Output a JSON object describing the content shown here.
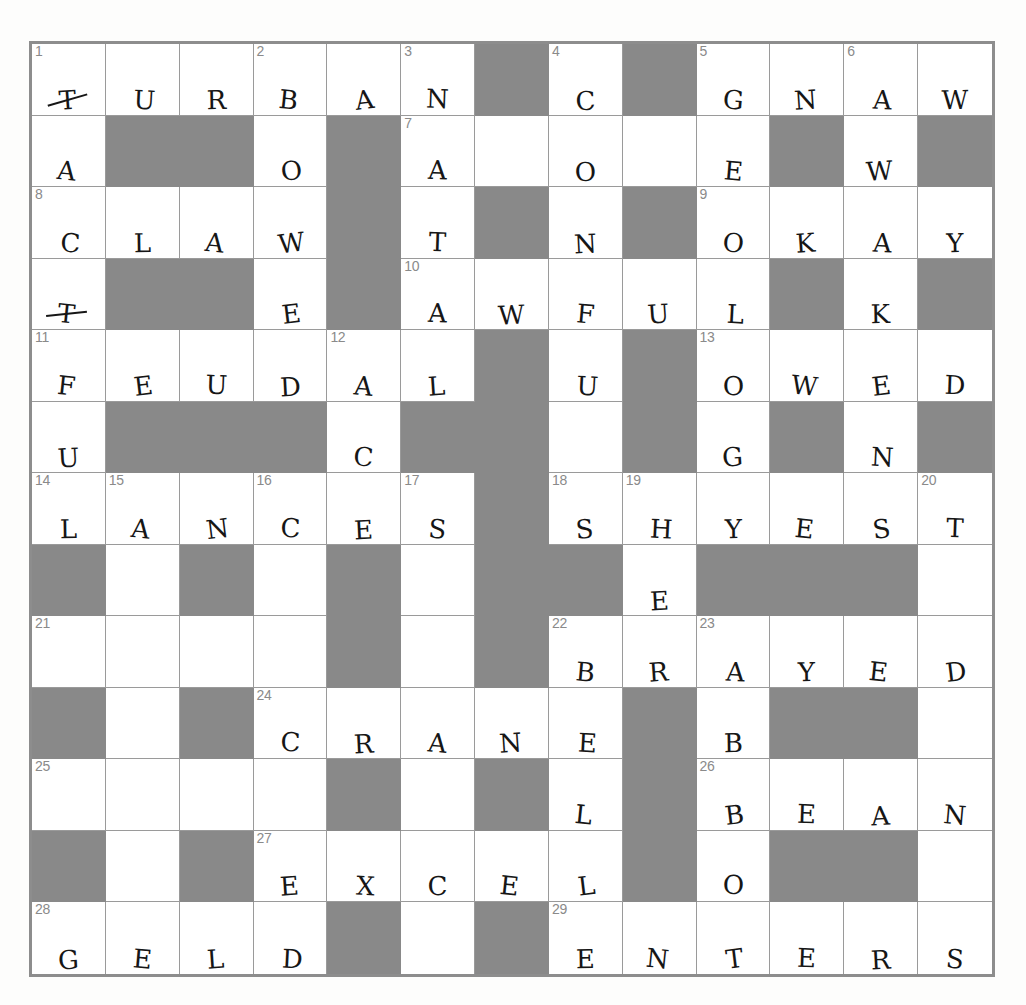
{
  "puzzle": {
    "kind": "crossword-grid",
    "columns": 13,
    "rows": 13,
    "block_color": "#898989",
    "cell_color": "#ffffff",
    "grid_line_color": "#9a9a9a",
    "border_color": "#8d8d8d",
    "number_color": "#8a8a8a",
    "letter_color": "#161616",
    "cells": [
      [
        {
          "t": "o",
          "n": "1",
          "l": "T",
          "s": true
        },
        {
          "t": "o",
          "l": "U"
        },
        {
          "t": "o",
          "l": "R"
        },
        {
          "t": "o",
          "n": "2",
          "l": "B"
        },
        {
          "t": "o",
          "l": "A"
        },
        {
          "t": "o",
          "n": "3",
          "l": "N"
        },
        {
          "t": "b"
        },
        {
          "t": "o",
          "n": "4",
          "l": "C"
        },
        {
          "t": "b"
        },
        {
          "t": "o",
          "n": "5",
          "l": "G"
        },
        {
          "t": "o",
          "l": "N"
        },
        {
          "t": "o",
          "n": "6",
          "l": "A"
        },
        {
          "t": "o",
          "l": "W"
        }
      ],
      [
        {
          "t": "o",
          "l": "A"
        },
        {
          "t": "b"
        },
        {
          "t": "b"
        },
        {
          "t": "o",
          "l": "O"
        },
        {
          "t": "b"
        },
        {
          "t": "o",
          "n": "7",
          "l": "A"
        },
        {
          "t": "o",
          "l": ""
        },
        {
          "t": "o",
          "l": "O"
        },
        {
          "t": "o",
          "l": ""
        },
        {
          "t": "o",
          "l": "E"
        },
        {
          "t": "b"
        },
        {
          "t": "o",
          "l": "W"
        },
        {
          "t": "b"
        }
      ],
      [
        {
          "t": "o",
          "n": "8",
          "l": "C"
        },
        {
          "t": "o",
          "l": "L"
        },
        {
          "t": "o",
          "l": "A"
        },
        {
          "t": "o",
          "l": "W"
        },
        {
          "t": "b"
        },
        {
          "t": "o",
          "l": "T"
        },
        {
          "t": "b"
        },
        {
          "t": "o",
          "l": "N"
        },
        {
          "t": "b"
        },
        {
          "t": "o",
          "n": "9",
          "l": "O"
        },
        {
          "t": "o",
          "l": "K"
        },
        {
          "t": "o",
          "l": "A"
        },
        {
          "t": "o",
          "l": "Y"
        }
      ],
      [
        {
          "t": "o",
          "l": "T",
          "s": true
        },
        {
          "t": "b"
        },
        {
          "t": "b"
        },
        {
          "t": "o",
          "l": "E"
        },
        {
          "t": "b"
        },
        {
          "t": "o",
          "n": "10",
          "l": "A"
        },
        {
          "t": "o",
          "l": "W"
        },
        {
          "t": "o",
          "l": "F"
        },
        {
          "t": "o",
          "l": "U"
        },
        {
          "t": "o",
          "l": "L"
        },
        {
          "t": "b"
        },
        {
          "t": "o",
          "l": "K"
        },
        {
          "t": "b"
        }
      ],
      [
        {
          "t": "o",
          "n": "11",
          "l": "F"
        },
        {
          "t": "o",
          "l": "E"
        },
        {
          "t": "o",
          "l": "U"
        },
        {
          "t": "o",
          "l": "D"
        },
        {
          "t": "o",
          "n": "12",
          "l": "A"
        },
        {
          "t": "o",
          "l": "L"
        },
        {
          "t": "b"
        },
        {
          "t": "o",
          "l": "U"
        },
        {
          "t": "b"
        },
        {
          "t": "o",
          "n": "13",
          "l": "O"
        },
        {
          "t": "o",
          "l": "W"
        },
        {
          "t": "o",
          "l": "E"
        },
        {
          "t": "o",
          "l": "D"
        }
      ],
      [
        {
          "t": "o",
          "l": "U"
        },
        {
          "t": "b"
        },
        {
          "t": "b"
        },
        {
          "t": "b"
        },
        {
          "t": "o",
          "l": "C"
        },
        {
          "t": "b"
        },
        {
          "t": "b"
        },
        {
          "t": "o",
          "l": ""
        },
        {
          "t": "b"
        },
        {
          "t": "o",
          "l": "G"
        },
        {
          "t": "b"
        },
        {
          "t": "o",
          "l": "N"
        },
        {
          "t": "b"
        }
      ],
      [
        {
          "t": "o",
          "n": "14",
          "l": "L"
        },
        {
          "t": "o",
          "n": "15",
          "l": "A"
        },
        {
          "t": "o",
          "l": "N"
        },
        {
          "t": "o",
          "n": "16",
          "l": "C"
        },
        {
          "t": "o",
          "l": "E"
        },
        {
          "t": "o",
          "n": "17",
          "l": "S"
        },
        {
          "t": "b"
        },
        {
          "t": "o",
          "n": "18",
          "l": "S"
        },
        {
          "t": "o",
          "n": "19",
          "l": "H"
        },
        {
          "t": "o",
          "l": "Y"
        },
        {
          "t": "o",
          "l": "E"
        },
        {
          "t": "o",
          "l": "S"
        },
        {
          "t": "o",
          "n": "20",
          "l": "T"
        }
      ],
      [
        {
          "t": "b"
        },
        {
          "t": "o",
          "l": ""
        },
        {
          "t": "b"
        },
        {
          "t": "o",
          "l": ""
        },
        {
          "t": "b"
        },
        {
          "t": "o",
          "l": ""
        },
        {
          "t": "b"
        },
        {
          "t": "b"
        },
        {
          "t": "o",
          "l": "E"
        },
        {
          "t": "b"
        },
        {
          "t": "b"
        },
        {
          "t": "b"
        },
        {
          "t": "o",
          "l": ""
        }
      ],
      [
        {
          "t": "o",
          "n": "21",
          "l": ""
        },
        {
          "t": "o",
          "l": ""
        },
        {
          "t": "o",
          "l": ""
        },
        {
          "t": "o",
          "l": ""
        },
        {
          "t": "b"
        },
        {
          "t": "o",
          "l": ""
        },
        {
          "t": "b"
        },
        {
          "t": "o",
          "n": "22",
          "l": "B"
        },
        {
          "t": "o",
          "l": "R"
        },
        {
          "t": "o",
          "n": "23",
          "l": "A"
        },
        {
          "t": "o",
          "l": "Y"
        },
        {
          "t": "o",
          "l": "E"
        },
        {
          "t": "o",
          "l": "D"
        }
      ],
      [
        {
          "t": "b"
        },
        {
          "t": "o",
          "l": ""
        },
        {
          "t": "b"
        },
        {
          "t": "o",
          "n": "24",
          "l": "C"
        },
        {
          "t": "o",
          "l": "R"
        },
        {
          "t": "o",
          "l": "A"
        },
        {
          "t": "o",
          "l": "N"
        },
        {
          "t": "o",
          "l": "E"
        },
        {
          "t": "b"
        },
        {
          "t": "o",
          "l": "B"
        },
        {
          "t": "b"
        },
        {
          "t": "b"
        },
        {
          "t": "o",
          "l": ""
        }
      ],
      [
        {
          "t": "o",
          "n": "25",
          "l": ""
        },
        {
          "t": "o",
          "l": ""
        },
        {
          "t": "o",
          "l": ""
        },
        {
          "t": "o",
          "l": ""
        },
        {
          "t": "b"
        },
        {
          "t": "o",
          "l": ""
        },
        {
          "t": "b"
        },
        {
          "t": "o",
          "l": "L"
        },
        {
          "t": "b"
        },
        {
          "t": "o",
          "n": "26",
          "l": "B"
        },
        {
          "t": "o",
          "l": "E"
        },
        {
          "t": "o",
          "l": "A"
        },
        {
          "t": "o",
          "l": "N"
        }
      ],
      [
        {
          "t": "b"
        },
        {
          "t": "o",
          "l": ""
        },
        {
          "t": "b"
        },
        {
          "t": "o",
          "n": "27",
          "l": "E"
        },
        {
          "t": "o",
          "l": "X"
        },
        {
          "t": "o",
          "l": "C"
        },
        {
          "t": "o",
          "l": "E"
        },
        {
          "t": "o",
          "l": "L"
        },
        {
          "t": "b"
        },
        {
          "t": "o",
          "l": "O"
        },
        {
          "t": "b"
        },
        {
          "t": "b"
        },
        {
          "t": "o",
          "l": ""
        }
      ],
      [
        {
          "t": "o",
          "n": "28",
          "l": "G"
        },
        {
          "t": "o",
          "l": "E"
        },
        {
          "t": "o",
          "l": "L"
        },
        {
          "t": "o",
          "l": "D"
        },
        {
          "t": "b"
        },
        {
          "t": "o",
          "l": ""
        },
        {
          "t": "b"
        },
        {
          "t": "o",
          "n": "29",
          "l": "E"
        },
        {
          "t": "o",
          "l": "N"
        },
        {
          "t": "o",
          "l": "T"
        },
        {
          "t": "o",
          "l": "E"
        },
        {
          "t": "o",
          "l": "R"
        },
        {
          "t": "o",
          "l": "S"
        }
      ]
    ],
    "entries_across": [
      {
        "number": "1",
        "answer": "TURBAN"
      },
      {
        "number": "4",
        "answer": "C"
      },
      {
        "number": "5",
        "answer": "GNAW"
      },
      {
        "number": "8",
        "answer": "CLAW"
      },
      {
        "number": "9",
        "answer": "OKAY"
      },
      {
        "number": "10",
        "answer": "AWFUL"
      },
      {
        "number": "11",
        "answer": "FEUDAL"
      },
      {
        "number": "13",
        "answer": "OWED"
      },
      {
        "number": "14",
        "answer": "LANCES"
      },
      {
        "number": "18",
        "answer": "SHYEST"
      },
      {
        "number": "22",
        "answer": "BRAYED"
      },
      {
        "number": "24",
        "answer": "CRANE"
      },
      {
        "number": "26",
        "answer": "BEAN"
      },
      {
        "number": "27",
        "answer": "EXCEL"
      },
      {
        "number": "28",
        "answer": "GELD"
      },
      {
        "number": "29",
        "answer": "ENTERS"
      }
    ],
    "entries_down": [
      {
        "number": "1",
        "answer": "TACTFUL"
      },
      {
        "number": "2",
        "answer": "BOWE"
      },
      {
        "number": "3",
        "answer": "N"
      },
      {
        "number": "4",
        "answer": "CONU"
      },
      {
        "number": "5",
        "answer": "GEO"
      },
      {
        "number": "6",
        "answer": "AWAK"
      },
      {
        "number": "7",
        "answer": "AT A"
      },
      {
        "number": "12",
        "answer": "AC"
      },
      {
        "number": "13",
        "answer": "OG"
      },
      {
        "number": "19",
        "answer": "HE"
      },
      {
        "number": "20",
        "answer": "T"
      },
      {
        "number": "23",
        "answer": "ABO"
      }
    ]
  }
}
